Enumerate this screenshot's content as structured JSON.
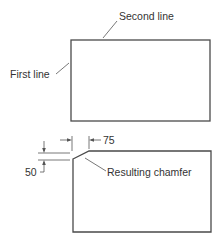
{
  "diagram": {
    "colors": {
      "line": "#4a4a4a",
      "text": "#333333",
      "background": "#ffffff"
    },
    "top_figure": {
      "labels": {
        "first_line": "First line",
        "second_line": "Second line"
      }
    },
    "bottom_figure": {
      "labels": {
        "result": "Resulting chamfer"
      },
      "dimensions": {
        "horizontal": "75",
        "vertical": "50"
      }
    }
  }
}
